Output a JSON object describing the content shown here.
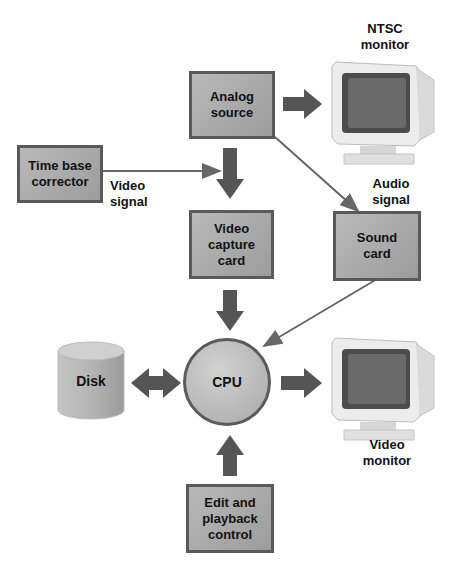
{
  "diagram": {
    "nodes": {
      "analog_source": "Analog source",
      "time_base_corrector": "Time base corrector",
      "video_capture_card": "Video capture card",
      "sound_card": "Sound card",
      "cpu": "CPU",
      "disk": "Disk",
      "edit_playback_control": "Edit and playback control"
    },
    "labels": {
      "ntsc_monitor_line1": "NTSC",
      "ntsc_monitor_line2": "monitor",
      "video_signal_line1": "Video",
      "video_signal_line2": "signal",
      "audio_signal_line1": "Audio",
      "audio_signal_line2": "signal",
      "video_monitor_line1": "Video",
      "video_monitor_line2": "monitor"
    },
    "node_lines": {
      "analog_source": [
        "Analog",
        "source"
      ],
      "time_base_corrector": [
        "Time base",
        "corrector"
      ],
      "video_capture_card": [
        "Video",
        "capture",
        "card"
      ],
      "sound_card": [
        "Sound",
        "card"
      ],
      "edit_playback_control": [
        "Edit and",
        "playback",
        "control"
      ]
    },
    "colors": {
      "box_fill": "#a9a9a9",
      "box_border": "#5a5a5a",
      "arrow": "#555555",
      "line": "#666666"
    }
  }
}
